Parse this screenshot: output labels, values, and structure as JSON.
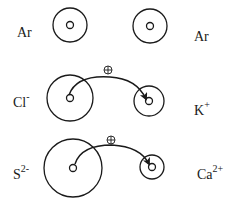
{
  "diagram": {
    "stroke_color": "#1a1a1a",
    "background": "#ffffff",
    "rows": [
      {
        "id": "argon-row",
        "left": {
          "symbol": "Ar",
          "charge": "",
          "label_x": 17,
          "label_y": 26
        },
        "right": {
          "symbol": "Ar",
          "charge": "",
          "label_x": 194,
          "label_y": 30
        },
        "left_circle": {
          "cx": 70,
          "cy": 25,
          "r": 17,
          "nucleus_r": 3.5
        },
        "right_circle": {
          "cx": 150,
          "cy": 26,
          "r": 17,
          "nucleus_r": 3.5
        },
        "arrow": null
      },
      {
        "id": "chloride-potassium-row",
        "left": {
          "symbol": "Cl",
          "charge": "-",
          "label_x": 13,
          "label_y": 96
        },
        "right": {
          "symbol": "K",
          "charge": "+",
          "label_x": 194,
          "label_y": 104
        },
        "left_circle": {
          "cx": 70,
          "cy": 98,
          "r": 23,
          "nucleus_r": 3.5
        },
        "right_circle": {
          "cx": 149,
          "cy": 101,
          "r": 15,
          "nucleus_r": 3.5
        },
        "arrow": {
          "path": "M 69 95 C 75 78, 95 76, 110 77 C 128 78, 140 86, 146 99",
          "plus_x": 104,
          "plus_y": 66
        }
      },
      {
        "id": "sulfide-calcium-row",
        "left": {
          "symbol": "S",
          "charge": "2-",
          "label_x": 13,
          "label_y": 168
        },
        "right": {
          "symbol": "Ca",
          "charge": "2+",
          "label_x": 197,
          "label_y": 168
        },
        "left_circle": {
          "cx": 73,
          "cy": 168,
          "r": 29,
          "nucleus_r": 3.5
        },
        "right_circle": {
          "cx": 152,
          "cy": 167,
          "r": 12,
          "nucleus_r": 3.5
        },
        "arrow": {
          "path": "M 75 164 C 80 148, 98 145, 112 145 C 130 146, 143 152, 149 164",
          "plus_x": 107,
          "plus_y": 136
        }
      }
    ],
    "transfer_symbol": "⊕"
  }
}
